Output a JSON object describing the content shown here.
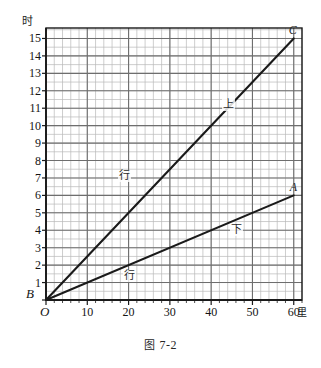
{
  "figure": {
    "caption_prefix": "图",
    "caption_number": "7-2"
  },
  "chart_data": {
    "type": "line",
    "title": "",
    "xlabel": "里",
    "ylabel": "时",
    "xlim": [
      0,
      62
    ],
    "ylim": [
      0,
      15.6
    ],
    "x_ticks": [
      10,
      20,
      30,
      40,
      50,
      60
    ],
    "y_ticks": [
      1,
      2,
      3,
      4,
      5,
      6,
      7,
      8,
      9,
      10,
      11,
      12,
      13,
      14,
      15
    ],
    "x_major_step": 10,
    "x_minor_step": 2,
    "y_major_step": 1,
    "y_minor_step": 0.5,
    "grid": true,
    "origin_label": "O",
    "y_origin_label": "B",
    "legend_position": "inline-annotation",
    "series": [
      {
        "name": "上行",
        "label_part1": "上",
        "label_part2": "行",
        "endpoint_label": "C",
        "points": [
          [
            0,
            0
          ],
          [
            60,
            15
          ]
        ],
        "slope": 0.25,
        "color": "#1a1a1a"
      },
      {
        "name": "下行",
        "label_part1": "下",
        "label_part2": "行",
        "endpoint_label": "A",
        "points": [
          [
            0,
            0
          ],
          [
            60,
            6
          ]
        ],
        "slope": 0.1,
        "color": "#1a1a1a"
      }
    ],
    "annotations": [
      {
        "text": "上",
        "x": 44,
        "y": 11.2
      },
      {
        "text": "行",
        "x": 19,
        "y": 7.1
      },
      {
        "text": "下",
        "x": 46,
        "y": 4.0
      },
      {
        "text": "行",
        "x": 20,
        "y": 1.4
      }
    ],
    "colors": {
      "line": "#1a1a1a",
      "axis": "#1a1a1a",
      "grid_major": "#6e6e6e",
      "grid_minor": "#b9b9b9",
      "background": "#ffffff"
    }
  }
}
